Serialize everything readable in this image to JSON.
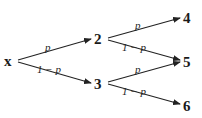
{
  "diagram": {
    "type": "probability-tree",
    "nodes": [
      {
        "id": "x",
        "label": "x",
        "x": 12,
        "y": 61
      },
      {
        "id": "n2",
        "label": "2",
        "x": 99,
        "y": 39
      },
      {
        "id": "n3",
        "label": "3",
        "x": 99,
        "y": 84
      },
      {
        "id": "n4",
        "label": "4",
        "x": 187,
        "y": 18
      },
      {
        "id": "n5",
        "label": "5",
        "x": 187,
        "y": 62
      },
      {
        "id": "n6",
        "label": "6",
        "x": 187,
        "y": 106
      }
    ],
    "edges": [
      {
        "from": "x",
        "to": "n2",
        "label": "p"
      },
      {
        "from": "x",
        "to": "n3",
        "label": "1 − p"
      },
      {
        "from": "n2",
        "to": "n4",
        "label": "p"
      },
      {
        "from": "n2",
        "to": "n5",
        "label": "1 − p"
      },
      {
        "from": "n3",
        "to": "n5",
        "label": "p"
      },
      {
        "from": "n3",
        "to": "n6",
        "label": "1 − p"
      }
    ]
  }
}
